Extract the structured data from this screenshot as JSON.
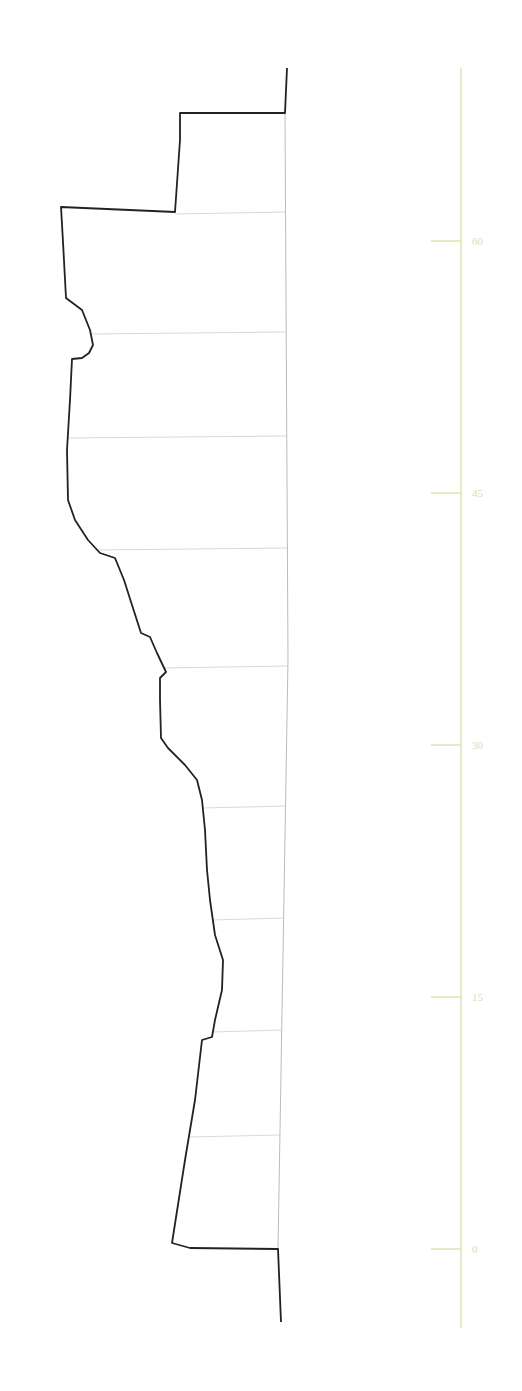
{
  "chart_data": {
    "type": "line",
    "title": "",
    "scale": {
      "ticks": [
        0,
        15,
        30,
        45,
        60
      ],
      "tick_labels": [
        "0",
        "15",
        "30",
        "45",
        "60"
      ],
      "range": [
        -3,
        70
      ],
      "color": "#d4df9a"
    },
    "profile_points_px": [
      [
        287,
        68
      ],
      [
        285,
        113
      ],
      [
        180,
        113
      ],
      [
        180,
        140
      ],
      [
        175,
        212
      ],
      [
        61,
        207
      ],
      [
        63,
        242
      ],
      [
        66,
        298
      ],
      [
        82,
        310
      ],
      [
        90,
        330
      ],
      [
        93,
        345
      ],
      [
        89,
        353
      ],
      [
        82,
        358
      ],
      [
        72,
        359
      ],
      [
        70,
        400
      ],
      [
        67,
        450
      ],
      [
        68,
        500
      ],
      [
        75,
        520
      ],
      [
        88,
        540
      ],
      [
        100,
        553
      ],
      [
        115,
        558
      ],
      [
        124,
        580
      ],
      [
        132,
        605
      ],
      [
        141,
        633
      ],
      [
        150,
        637
      ],
      [
        157,
        653
      ],
      [
        166,
        672
      ],
      [
        160,
        678
      ],
      [
        160,
        700
      ],
      [
        161,
        738
      ],
      [
        168,
        748
      ],
      [
        185,
        765
      ],
      [
        197,
        780
      ],
      [
        202,
        800
      ],
      [
        205,
        830
      ],
      [
        207,
        870
      ],
      [
        210,
        900
      ],
      [
        215,
        935
      ],
      [
        223,
        960
      ],
      [
        222,
        990
      ],
      [
        215,
        1020
      ],
      [
        212,
        1037
      ],
      [
        202,
        1040
      ],
      [
        195,
        1100
      ],
      [
        185,
        1160
      ],
      [
        172,
        1243
      ],
      [
        190,
        1248
      ],
      [
        278,
        1249
      ],
      [
        281,
        1322
      ]
    ],
    "baseline_px": [
      [
        285,
        113
      ],
      [
        288,
        660
      ],
      [
        278,
        1249
      ]
    ],
    "sample_lines_y_px": [
      212,
      332,
      436,
      548,
      666,
      806,
      918,
      1030,
      1135
    ],
    "colors": {
      "outline": "#222222",
      "sample_lines": "#d9d9d9",
      "baseline": "#bbbbbb",
      "axis": "#d4df9a",
      "tick_label": "#d8e0b0"
    }
  }
}
